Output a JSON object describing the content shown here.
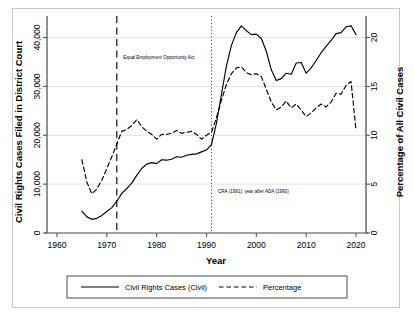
{
  "chart_data": {
    "type": "line",
    "title": "",
    "xlabel": "Year",
    "ylabel": "Civil Rights Cases Filed in District Court",
    "y2label": "Percentage of All Civil Cases",
    "xlim": [
      1958,
      2022
    ],
    "ylim": [
      0,
      44000
    ],
    "y2lim": [
      0,
      22
    ],
    "grid": true,
    "legend_position": "bottom",
    "xticks": [
      "1960",
      "1970",
      "1980",
      "1990",
      "2000",
      "2010",
      "2020"
    ],
    "xtick_values": [
      1960,
      1970,
      1980,
      1990,
      2000,
      2010,
      2020
    ],
    "yticks": [
      "0",
      "10,000",
      "20,000",
      "30,000",
      "40,000"
    ],
    "ytick_values": [
      0,
      10000,
      20000,
      30000,
      40000
    ],
    "y2ticks": [
      "0",
      "5",
      "10",
      "15",
      "20"
    ],
    "y2tick_values": [
      0,
      5,
      10,
      15,
      20
    ],
    "x": [
      1965,
      1966,
      1967,
      1968,
      1969,
      1970,
      1971,
      1972,
      1973,
      1974,
      1975,
      1976,
      1977,
      1978,
      1979,
      1980,
      1981,
      1982,
      1983,
      1984,
      1985,
      1986,
      1987,
      1988,
      1989,
      1990,
      1991,
      1992,
      1993,
      1994,
      1995,
      1996,
      1997,
      1998,
      1999,
      2000,
      2001,
      2002,
      2003,
      2004,
      2005,
      2006,
      2007,
      2008,
      2009,
      2010,
      2011,
      2012,
      2013,
      2014,
      2015,
      2016,
      2017,
      2018,
      2019,
      2020
    ],
    "series": [
      {
        "name": "Civil Rights Cases (Civil)",
        "axis": "left",
        "style": "solid",
        "color": "#000000",
        "values": [
          4500,
          3300,
          2800,
          3000,
          3600,
          4400,
          5200,
          6500,
          8100,
          9100,
          10200,
          11800,
          13200,
          14100,
          14400,
          14200,
          15000,
          14900,
          15100,
          15600,
          15500,
          15900,
          16100,
          16200,
          16600,
          17000,
          18100,
          22500,
          28400,
          34200,
          38400,
          41000,
          42400,
          41400,
          40600,
          40700,
          39800,
          37200,
          33400,
          31200,
          31600,
          32700,
          32500,
          34800,
          34900,
          32700,
          33800,
          35300,
          36900,
          38200,
          39400,
          40800,
          41000,
          42200,
          42400,
          40600
        ]
      },
      {
        "name": "Percentage",
        "axis": "right",
        "style": "dashed",
        "color": "#000000",
        "values": [
          7.5,
          5.2,
          4.0,
          4.5,
          5.4,
          6.6,
          7.8,
          9.1,
          10.4,
          10.6,
          11.0,
          11.6,
          10.9,
          10.4,
          10.1,
          9.6,
          10.1,
          10.1,
          10.2,
          10.5,
          10.2,
          10.3,
          10.4,
          10.1,
          9.6,
          10.0,
          10.3,
          11.8,
          13.6,
          15.2,
          16.3,
          16.9,
          17.0,
          16.4,
          16.2,
          16.3,
          16.0,
          14.7,
          13.4,
          12.6,
          12.9,
          13.5,
          12.8,
          13.2,
          12.6,
          11.9,
          12.3,
          12.8,
          13.2,
          12.9,
          13.4,
          14.3,
          14.2,
          15.1,
          15.5,
          10.5
        ]
      }
    ],
    "annotations": [
      {
        "text": "Equal Employment Opportunity Act",
        "x_value": 1972,
        "line_style": "long-dash",
        "label_x": 1973,
        "label_y": 35600
      },
      {
        "text": "CRA (1991), year after ADA (1990)",
        "x_value": 1991,
        "line_style": "dotted",
        "label_x": 1992,
        "label_y": 8200
      }
    ]
  },
  "legend": {
    "items": [
      {
        "label": "Civil Rights Cases (Civil)",
        "style": "solid"
      },
      {
        "label": "Percentage",
        "style": "dashed"
      }
    ]
  }
}
